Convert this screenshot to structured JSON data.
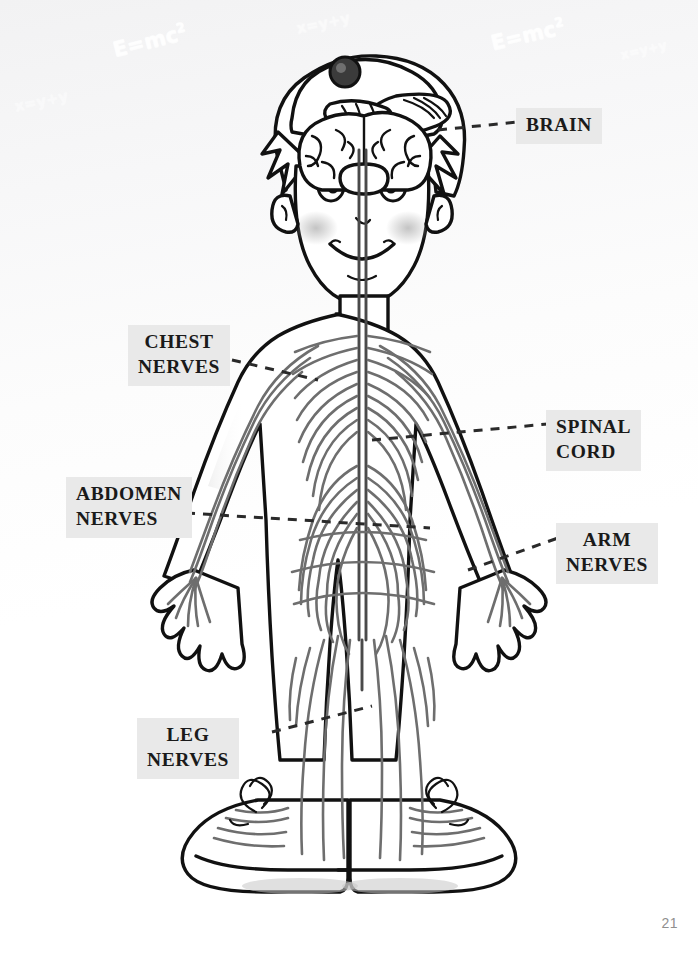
{
  "page": {
    "number": "21",
    "background_color": "#fafafa",
    "label_background_color": "#e9e9e9",
    "label_text_color": "#1a1a1a",
    "nerve_color": "#6e6e6e",
    "outline_color": "#111111"
  },
  "background_formulas": [
    {
      "id": "formula-emc2-left",
      "text": "E=mc²",
      "x": 112,
      "y": 28,
      "size": 21,
      "rotate": -14,
      "opacity": 0.95
    },
    {
      "id": "formula-xyy-top",
      "text": "x=y+y",
      "x": 296,
      "y": 14,
      "size": 15,
      "rotate": -12,
      "opacity": 0.55
    },
    {
      "id": "formula-emc2-right",
      "text": "E=mc²",
      "x": 490,
      "y": 22,
      "size": 21,
      "rotate": -13,
      "opacity": 0.95
    },
    {
      "id": "formula-xyy-right",
      "text": "x=y+y",
      "x": 620,
      "y": 42,
      "size": 13,
      "rotate": -13,
      "opacity": 0.5
    },
    {
      "id": "formula-xyy-left",
      "text": "x=y+y",
      "x": 14,
      "y": 92,
      "size": 15,
      "rotate": -12,
      "opacity": 0.45
    }
  ],
  "illustration": {
    "subject": "cartoon boy with backwards baseball cap showing the human nervous system",
    "parts": [
      "brain",
      "spinal cord",
      "chest nerves",
      "abdomen nerves",
      "arm nerves",
      "leg nerves",
      "sneakers with laces"
    ]
  },
  "callouts": [
    {
      "id": "brain",
      "text": "BRAIN",
      "align": "center",
      "leader": "dashed"
    },
    {
      "id": "chest",
      "text": "CHEST\nNERVES",
      "align": "center",
      "leader": "dashed"
    },
    {
      "id": "spinal",
      "text": "SPINAL\nCORD",
      "align": "left",
      "leader": "dashed"
    },
    {
      "id": "abdomen",
      "text": "ABDOMEN\nNERVES",
      "align": "left",
      "leader": "dashed"
    },
    {
      "id": "arm",
      "text": "ARM\nNERVES",
      "align": "center",
      "leader": "dashed"
    },
    {
      "id": "leg",
      "text": "LEG\nNERVES",
      "align": "center",
      "leader": "dashed"
    }
  ]
}
